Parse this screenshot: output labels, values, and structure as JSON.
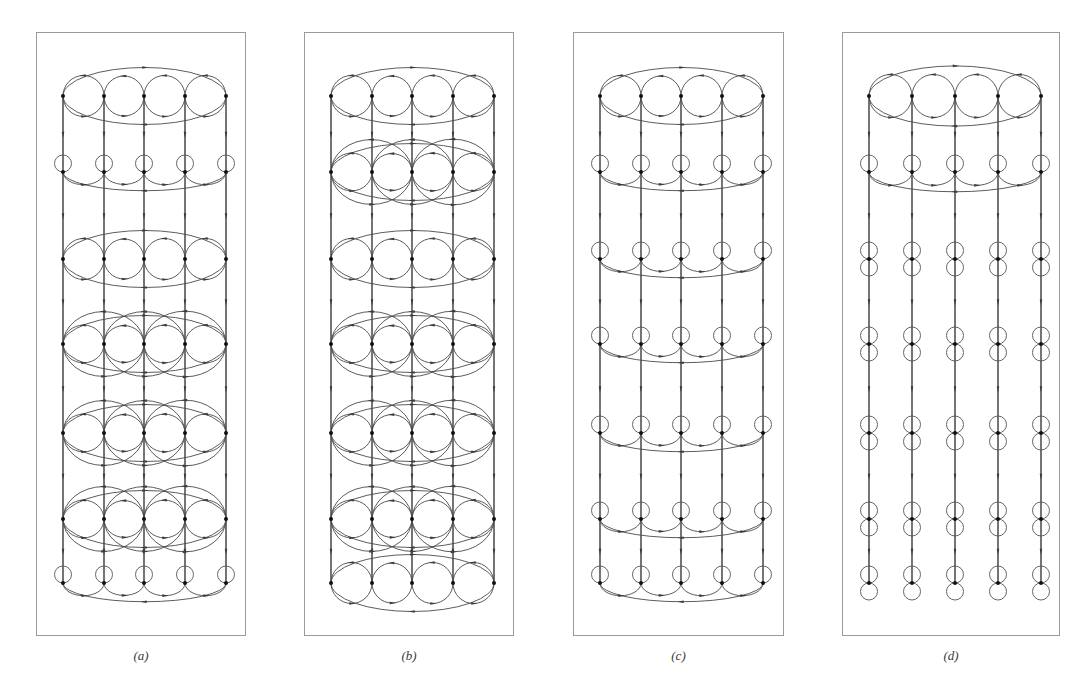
{
  "figure": {
    "width": 1090,
    "height": 694,
    "background": "#ffffff",
    "type": "graph-diagram-figure",
    "stroke_color": "#4a4a4a",
    "node_color": "#111111",
    "border_color": "#9a9a9a"
  },
  "panels": [
    {
      "id": "a",
      "label": "(a)",
      "box": {
        "x": 36,
        "y": 32,
        "width": 210,
        "height": 604
      },
      "columns_x": [
        62,
        103,
        143,
        184,
        225
      ],
      "rows_y": [
        95,
        171,
        258,
        343,
        432,
        518,
        582
      ],
      "row_styles": [
        "full-circle-plus-outer-ellipse",
        "self-loop-plus-lower-arc-ellipse",
        "full-circle-plus-outer-ellipse",
        "wide-oval-plus-outer-ellipse",
        "wide-oval-plus-outer-ellipse",
        "wide-oval-plus-outer-ellipse",
        "self-loop-plus-lower-arc-ellipse"
      ]
    },
    {
      "id": "b",
      "label": "(b)",
      "box": {
        "x": 304,
        "y": 32,
        "width": 210,
        "height": 604
      },
      "columns_x": [
        330,
        371,
        411,
        452,
        493
      ],
      "rows_y": [
        95,
        171,
        258,
        343,
        432,
        518,
        582
      ],
      "row_styles": [
        "full-circle-plus-outer-ellipse",
        "wide-oval-plus-outer-ellipse",
        "full-circle-plus-outer-ellipse",
        "wide-oval-plus-outer-ellipse",
        "wide-oval-plus-outer-ellipse",
        "wide-oval-plus-outer-ellipse",
        "full-circle-plus-outer-ellipse"
      ]
    },
    {
      "id": "c",
      "label": "(c)",
      "box": {
        "x": 573,
        "y": 32,
        "width": 211,
        "height": 604
      },
      "columns_x": [
        599,
        640,
        680,
        721,
        762
      ],
      "rows_y": [
        95,
        171,
        258,
        343,
        432,
        518,
        582
      ],
      "row_styles": [
        "full-circle-plus-outer-ellipse",
        "self-loop-plus-lower-arc-ellipse",
        "self-loop-plus-lower-arc-ellipse",
        "self-loop-plus-lower-arc-ellipse",
        "self-loop-plus-lower-arc-ellipse",
        "self-loop-plus-lower-arc-ellipse",
        "self-loop-plus-lower-arc-ellipse"
      ]
    },
    {
      "id": "d",
      "label": "(d)",
      "box": {
        "x": 842,
        "y": 32,
        "width": 218,
        "height": 604
      },
      "columns_x": [
        868,
        911,
        954,
        997,
        1040
      ],
      "rows_y": [
        95,
        171,
        258,
        343,
        432,
        518,
        582
      ],
      "row_styles": [
        "full-circle-plus-outer-ellipse",
        "self-loop-plus-lower-arc-ellipse",
        "double-self-loop-only",
        "double-self-loop-only",
        "double-self-loop-only",
        "double-self-loop-only",
        "double-self-loop-only"
      ]
    }
  ],
  "legend": {
    "node_count_per_row": 5,
    "row_count": 7,
    "panel_count": 4
  }
}
